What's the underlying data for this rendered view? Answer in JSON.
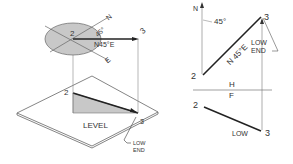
{
  "left_figure": {
    "point_2": "2",
    "point_3": "3",
    "angle": "45°",
    "north": "N",
    "east": "E",
    "bearing": "N45°E",
    "plane_label": "LEVEL",
    "plate_point_2": "2",
    "plate_point_3": "3",
    "low_end_line1": "LOW",
    "low_end_line2": "END"
  },
  "right_figure": {
    "north": "N",
    "angle": "45°",
    "bearing": "N 45°E",
    "top_point_2": "2",
    "top_point_3": "3",
    "low_end_line1": "LOW",
    "low_end_line2": "END",
    "fold_top": "H",
    "fold_bottom": "F",
    "front_point_2": "2",
    "front_point_3": "3",
    "front_low": "LOW"
  },
  "colors": {
    "line": "#222222",
    "thin": "#777777",
    "shade": "#c8c8c8"
  }
}
